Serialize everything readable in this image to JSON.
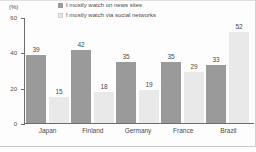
{
  "chart_data": {
    "type": "bar",
    "title": "",
    "xlabel": "",
    "ylabel": "(%)",
    "ylim": [
      0,
      60
    ],
    "yticks": [
      0,
      20,
      40,
      60
    ],
    "grid": false,
    "legend_position": "top",
    "categories": [
      "Japan",
      "Finland",
      "Germany",
      "France",
      "Brazil"
    ],
    "series": [
      {
        "name": "I mostly watch on news sites",
        "color": "#9a9a9a",
        "values": [
          39,
          42,
          35,
          35,
          33
        ]
      },
      {
        "name": "I mostly watch via social networks",
        "color": "#e9e9e9",
        "values": [
          15,
          18,
          19,
          29,
          52
        ]
      }
    ]
  },
  "axis": {
    "unit_label": "(%)",
    "tick_labels": [
      "60",
      "40",
      "20",
      "0"
    ]
  },
  "legend": {
    "items": [
      {
        "label": "I mostly watch on news sites",
        "swatch": "dark"
      },
      {
        "label": "I mostly watch via social networks",
        "swatch": "light"
      }
    ]
  }
}
